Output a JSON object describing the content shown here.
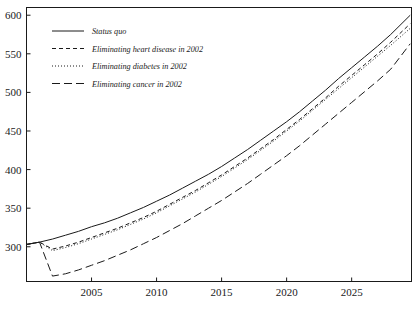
{
  "chart_data": {
    "type": "line",
    "title": "",
    "subtitle": "",
    "xlabel": "",
    "ylabel": "",
    "xlim": [
      2000,
      2029.6
    ],
    "ylim": [
      255,
      610
    ],
    "grid": false,
    "legend_position": "top-left",
    "xticks": [
      2005,
      2010,
      2015,
      2020,
      2025
    ],
    "xticklabels": [
      "2005",
      "2010",
      "2015",
      "2020",
      "2025"
    ],
    "yticks": [
      300,
      350,
      400,
      450,
      500,
      550,
      600
    ],
    "yticklabels": [
      "300",
      "350",
      "400",
      "450",
      "500",
      "550",
      "600"
    ],
    "x": [
      2000,
      2001,
      2002,
      2003,
      2004,
      2005,
      2006,
      2007,
      2008,
      2009,
      2010,
      2011,
      2012,
      2013,
      2014,
      2015,
      2016,
      2017,
      2018,
      2019,
      2020,
      2021,
      2022,
      2023,
      2024,
      2025,
      2026,
      2027,
      2028,
      2029.5
    ],
    "series": [
      {
        "name": "Status quo",
        "style": "solid",
        "dasharray": "none",
        "color": "#1a1a1a",
        "values": [
          303,
          306,
          310,
          315,
          320,
          326,
          331,
          337,
          344,
          351,
          359,
          367,
          376,
          385,
          394,
          404,
          415,
          426,
          438,
          450,
          462,
          475,
          489,
          503,
          518,
          532,
          546,
          560,
          575,
          600
        ]
      },
      {
        "name": "Eliminating heart disease in 2002",
        "style": "dashed",
        "dasharray": "4,3",
        "color": "#1a1a1a",
        "values": [
          303,
          306,
          297,
          301,
          306,
          312,
          318,
          324,
          331,
          338,
          346,
          355,
          364,
          373,
          383,
          393,
          404,
          415,
          427,
          439,
          452,
          465,
          479,
          493,
          508,
          522,
          536,
          550,
          565,
          589
        ]
      },
      {
        "name": "Eliminating diabetes in 2002",
        "style": "dotted",
        "dasharray": "1,2",
        "color": "#1a1a1a",
        "values": [
          303,
          306,
          295,
          299,
          304,
          310,
          316,
          322,
          329,
          336,
          344,
          353,
          362,
          371,
          381,
          391,
          402,
          413,
          425,
          437,
          450,
          463,
          477,
          491,
          505,
          519,
          533,
          547,
          561,
          583
        ]
      },
      {
        "name": "Eliminating cancer in 2002",
        "style": "long-dashed",
        "dasharray": "8,4",
        "color": "#1a1a1a",
        "values": [
          303,
          306,
          262,
          265,
          270,
          276,
          282,
          289,
          296,
          304,
          312,
          321,
          330,
          340,
          350,
          360,
          371,
          382,
          394,
          406,
          418,
          431,
          445,
          459,
          473,
          487,
          501,
          515,
          530,
          563
        ]
      }
    ],
    "legend": [
      {
        "label": "Status quo",
        "dasharray": "none"
      },
      {
        "label": "Eliminating heart disease in 2002",
        "dasharray": "4,3"
      },
      {
        "label": "Eliminating diabetes in 2002",
        "dasharray": "1,2"
      },
      {
        "label": "Eliminating cancer in 2002",
        "dasharray": "8,4"
      }
    ]
  }
}
